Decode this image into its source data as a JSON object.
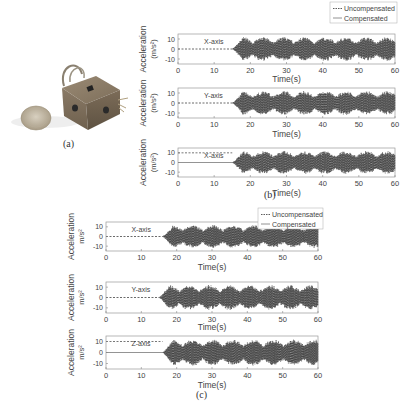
{
  "figure": {
    "panel_a": {
      "caption": "(a)",
      "description": "photo of cube-shaped sensor device next to a coin"
    },
    "panel_b": {
      "caption": "(b)",
      "legend": [
        "Uncompensated",
        "Compensated"
      ]
    },
    "panel_c": {
      "caption": "(c)",
      "legend": [
        "Uncompensated",
        "Compensated"
      ]
    }
  },
  "chart_data": [
    {
      "panel": "b",
      "type": "line",
      "title": "X-axis",
      "xlabel": "Time(s)",
      "ylabel": "Acceleration (m/s^2)",
      "xlim": [
        0,
        60
      ],
      "ylim": [
        -15,
        15
      ],
      "xticks": [
        0,
        10,
        20,
        30,
        40,
        50,
        60
      ],
      "yticks": [
        -10,
        0,
        10
      ],
      "legend": [
        "Uncompensated",
        "Compensated"
      ],
      "legend_position": "top-right (outside/overlapping)",
      "series": [
        {
          "name": "Uncompensated",
          "style": "dashed",
          "description": "flat at 0 until ~15 s, then oscillation up to ±12 m/s^2 through 60 s"
        },
        {
          "name": "Compensated",
          "style": "solid",
          "description": "flat at 0 until ~15 s, then oscillation up to ±12 m/s^2 through 60 s"
        }
      ],
      "annotation": "X-axis",
      "onset_s": 15
    },
    {
      "panel": "b",
      "type": "line",
      "title": "Y-axis",
      "xlabel": "Time(s)",
      "ylabel": "Acceleration (m/s^2)",
      "xlim": [
        0,
        60
      ],
      "ylim": [
        -15,
        15
      ],
      "xticks": [
        0,
        10,
        20,
        30,
        40,
        50,
        60
      ],
      "yticks": [
        -10,
        0,
        10
      ],
      "series": [
        {
          "name": "Uncompensated",
          "style": "dashed",
          "description": "flat at 0 until ~15 s, then oscillation ±12"
        },
        {
          "name": "Compensated",
          "style": "solid",
          "description": "flat at 0 until ~15 s, then oscillation ±12"
        }
      ],
      "annotation": "Y-axis",
      "onset_s": 15
    },
    {
      "panel": "b",
      "type": "line",
      "title": "X-axis",
      "xlabel": "Time(s)",
      "ylabel": "Acceleration (m/s^2)",
      "xlim": [
        0,
        60
      ],
      "ylim": [
        -15,
        15
      ],
      "xticks": [
        0,
        10,
        20,
        30,
        40,
        50,
        60
      ],
      "yticks": [
        -10,
        0,
        10
      ],
      "series": [
        {
          "name": "Uncompensated",
          "style": "dashed",
          "description": "constant ~10 until ~15 s (gravity offset), then oscillation"
        },
        {
          "name": "Compensated",
          "style": "solid",
          "description": "constant 0 until ~15 s, then oscillation ±12"
        }
      ],
      "annotation": "X-axis",
      "onset_s": 15
    },
    {
      "panel": "c",
      "type": "line",
      "title": "X-axis",
      "xlabel": "Time(s)",
      "ylabel": "Acceleration m/s^2",
      "xlim": [
        0,
        60
      ],
      "ylim": [
        -15,
        15
      ],
      "xticks": [
        0,
        10,
        20,
        30,
        40,
        50,
        60
      ],
      "yticks": [
        -10,
        0,
        10
      ],
      "legend": [
        "Uncompensated",
        "Compensated"
      ],
      "series": [
        {
          "name": "Uncompensated",
          "style": "dashed",
          "description": "flat at 0 until ~16 s, then oscillation ±12"
        },
        {
          "name": "Compensated",
          "style": "solid",
          "description": "flat at 0 until ~16 s, then oscillation ±12"
        }
      ],
      "annotation": "X-axis",
      "onset_s": 16
    },
    {
      "panel": "c",
      "type": "line",
      "title": "Y-axis",
      "xlabel": "Time(s)",
      "ylabel": "Acceleration m/s^2",
      "xlim": [
        0,
        60
      ],
      "ylim": [
        -15,
        15
      ],
      "xticks": [
        0,
        10,
        20,
        30,
        40,
        50,
        60
      ],
      "yticks": [
        -10,
        0,
        10
      ],
      "series": [
        {
          "name": "Uncompensated",
          "style": "dashed",
          "description": "flat at 0 until ~15 s, then oscillation ±12"
        },
        {
          "name": "Compensated",
          "style": "solid",
          "description": "flat at 0 until ~15 s, then oscillation ±12"
        }
      ],
      "annotation": "Y-axis",
      "onset_s": 15
    },
    {
      "panel": "c",
      "type": "line",
      "title": "Z-axis",
      "xlabel": "Time(s)",
      "ylabel": "Acceleration m/s^2",
      "xlim": [
        0,
        60
      ],
      "ylim": [
        -15,
        15
      ],
      "xticks": [
        0,
        10,
        20,
        30,
        40,
        50,
        60
      ],
      "yticks": [
        -10,
        0,
        10
      ],
      "series": [
        {
          "name": "Uncompensated",
          "style": "dashed",
          "description": "constant ~10 until ~16 s, then drops and oscillates"
        },
        {
          "name": "Compensated",
          "style": "solid",
          "description": "constant 0 until ~16 s, then oscillation ±12"
        }
      ],
      "annotation": "Z-axis",
      "onset_s": 16
    }
  ]
}
